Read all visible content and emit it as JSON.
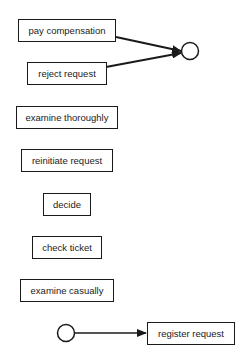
{
  "diagram": {
    "type": "process-model",
    "tasks": [
      {
        "id": "pay_compensation",
        "label": "pay compensation"
      },
      {
        "id": "reject_request",
        "label": "reject request"
      },
      {
        "id": "examine_thoroughly",
        "label": "examine thoroughly"
      },
      {
        "id": "reinitiate_request",
        "label": "reinitiate request"
      },
      {
        "id": "decide",
        "label": "decide"
      },
      {
        "id": "check_ticket",
        "label": "check ticket"
      },
      {
        "id": "examine_casually",
        "label": "examine casually"
      },
      {
        "id": "register_request",
        "label": "register request"
      }
    ],
    "places": [
      {
        "id": "start",
        "role": "start"
      },
      {
        "id": "end",
        "role": "end"
      }
    ],
    "edges": [
      {
        "from": "start",
        "to": "register_request"
      },
      {
        "from": "pay_compensation",
        "to": "end"
      },
      {
        "from": "reject_request",
        "to": "end"
      }
    ],
    "colors": {
      "stroke": "#1a1a1a",
      "fill": "#ffffff",
      "text": "#222222"
    }
  }
}
